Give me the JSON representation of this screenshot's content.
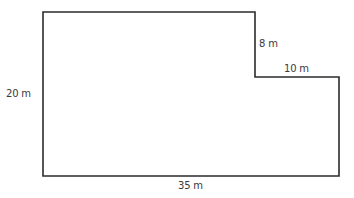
{
  "diagram": {
    "type": "L-shaped floor plan outline",
    "stroke_color": "#2b2b2b",
    "label_color": "#3a3a3a",
    "shape_points": [
      [
        43,
        12
      ],
      [
        255,
        12
      ],
      [
        255,
        77
      ],
      [
        339,
        77
      ],
      [
        339,
        176
      ],
      [
        43,
        176
      ]
    ],
    "labels": {
      "left_height": "20 m",
      "notch_height": "8 m",
      "notch_width": "10 m",
      "bottom_width": "35 m"
    }
  }
}
